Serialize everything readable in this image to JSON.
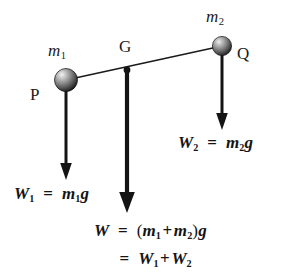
{
  "figure": {
    "kind": "physics-free-body-diagram",
    "background_color": "#ffffff",
    "ink_color": "#141414"
  },
  "points": [
    {
      "id": "P",
      "label": "P",
      "x": 66,
      "y": 80,
      "label_x": 30,
      "label_y": 88,
      "sphere_radius": 11,
      "mass_label": "m",
      "mass_subscript": "1",
      "mass_label_x": 48,
      "mass_label_y": 44
    },
    {
      "id": "G",
      "label": "G",
      "x": 127,
      "y": 70,
      "label_x": 119,
      "label_y": 40,
      "dot_radius": 3.2
    },
    {
      "id": "Q",
      "label": "Q",
      "x": 222,
      "y": 46,
      "label_x": 237,
      "label_y": 46,
      "sphere_radius": 9.5,
      "mass_label": "m",
      "mass_subscript": "2",
      "mass_label_x": 206,
      "mass_label_y": 10
    }
  ],
  "rod": {
    "from": "P",
    "to": "Q",
    "x1": 66,
    "y1": 80,
    "x2": 222,
    "y2": 46,
    "width": 1.6
  },
  "arrows": [
    {
      "id": "weight-p",
      "from_point": "P",
      "x": 66,
      "y_start": 80,
      "y_end": 178,
      "shaft_width": 3.0,
      "head_width": 11,
      "head_length": 15,
      "direction": "down"
    },
    {
      "id": "weight-g",
      "from_point": "G",
      "x": 127,
      "y_start": 70,
      "y_end": 212,
      "shaft_width": 4.2,
      "head_width": 15,
      "head_length": 20,
      "direction": "down"
    },
    {
      "id": "weight-q",
      "from_point": "Q",
      "x": 222,
      "y_start": 46,
      "y_end": 128,
      "shaft_width": 3.0,
      "head_width": 11,
      "head_length": 15,
      "direction": "down"
    }
  ],
  "equations": {
    "weight_1": {
      "id": "W1",
      "text": "W₁ = m₁g",
      "vector_symbol": "W",
      "vector_subscript": "1",
      "equals": "=",
      "scalar_symbol": "m",
      "scalar_subscript": "1",
      "gravity_symbol": "g",
      "x": 14,
      "y": 186
    },
    "weight_2": {
      "id": "W2",
      "text": "W₂ = m₂g",
      "vector_symbol": "W",
      "vector_subscript": "2",
      "equals": "=",
      "scalar_symbol": "m",
      "scalar_subscript": "2",
      "gravity_symbol": "g",
      "x": 178,
      "y": 136
    },
    "weight_total_line1": {
      "id": "W-total",
      "text": "W = (m₁ + m₂)g",
      "vector_symbol": "W",
      "equals": "=",
      "open_paren": "(",
      "term_1_symbol": "m",
      "term_1_subscript": "1",
      "plus": "+",
      "term_2_symbol": "m",
      "term_2_subscript": "2",
      "close_paren": ")",
      "gravity_symbol": "g"
    },
    "weight_total_line2": {
      "id": "W-total-sum",
      "text": "= W₁ + W₂",
      "equals": "=",
      "term_1_symbol": "W",
      "term_1_subscript": "1",
      "plus": "+",
      "term_2_symbol": "W",
      "term_2_subscript": "2"
    }
  }
}
